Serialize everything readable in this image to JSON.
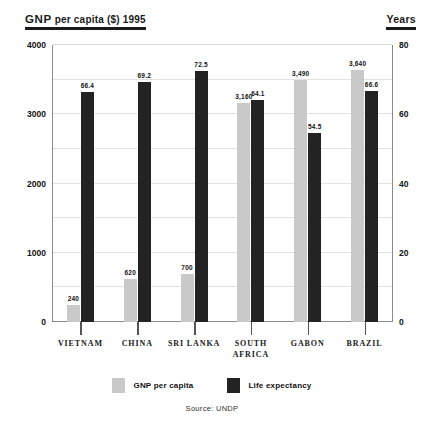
{
  "header": {
    "left_title_strong": "GNP",
    "left_title_rest": " per capita ($) 1995",
    "right_title": "Years"
  },
  "legend": {
    "items": [
      {
        "key": "gnp",
        "label_strong": "GNP",
        "label_rest": " per capita",
        "color": "#c9c9c9"
      },
      {
        "key": "life",
        "label_strong": "",
        "label_rest": "Life expectancy",
        "color": "#232323"
      }
    ]
  },
  "source": "Source: UNDP",
  "chart_data": {
    "type": "bar",
    "title": "GNP per capita ($) 1995",
    "xlabel": "",
    "ylabel": "GNP per capita ($) 1995",
    "y2label": "Years",
    "ylim": [
      0,
      4000
    ],
    "y2lim": [
      0,
      80
    ],
    "yticks": [
      "0",
      "1000",
      "2000",
      "3000",
      "4000"
    ],
    "y2ticks": [
      "0",
      "20",
      "40",
      "60",
      "80"
    ],
    "grid": true,
    "gridline_step": 500,
    "legend_position": "bottom",
    "categories": [
      "VIETNAM",
      "CHINA",
      "SRI LANKA",
      "SOUTH\nAFRICA",
      "GABON",
      "BRAZIL"
    ],
    "series": [
      {
        "name": "GNP per capita",
        "axis": "left",
        "color": "#c9c9c9",
        "values": [
          240,
          620,
          700,
          3160,
          3490,
          3640
        ],
        "labels": [
          "240",
          "620",
          "700",
          "3,160",
          "3,490",
          "3,640"
        ]
      },
      {
        "name": "Life expectancy",
        "axis": "right",
        "color": "#232323",
        "values": [
          66.4,
          69.2,
          72.5,
          64.1,
          54.5,
          66.6
        ],
        "labels": [
          "66.4",
          "69.2",
          "72.5",
          "64.1",
          "54.5",
          "66.6"
        ]
      }
    ]
  }
}
